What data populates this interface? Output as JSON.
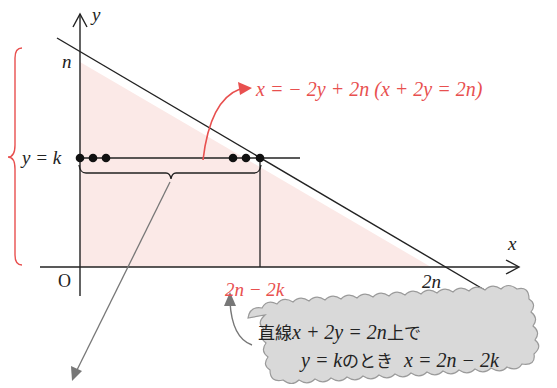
{
  "diagram": {
    "axes": {
      "x_label": "x",
      "y_label": "y",
      "origin_label": "O"
    },
    "y_ticks": {
      "n_label": "n",
      "k_label": "y = k"
    },
    "x_ticks": {
      "two_n_label": "2n",
      "intersection_label": "2n − 2k"
    },
    "line_equation": "x = − 2y + 2n  (x + 2y = 2n)",
    "callout": {
      "line1_prefix": "直線",
      "line1_math": "x + 2y = 2n",
      "line1_suffix": "上で",
      "line2_math_a": "y = k",
      "line2_text": "のとき",
      "line2_math_b": "x = 2n − 2k"
    },
    "colors": {
      "accent_red": "#e8504f",
      "region_fill": "#fbe9e7",
      "axis_black": "#222222",
      "cloud_fill": "#d9d9d9",
      "cloud_stroke": "#9a9a9a",
      "pointer_gray": "#777777"
    }
  }
}
